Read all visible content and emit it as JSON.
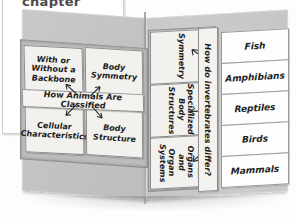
{
  "page": {
    "chapter_label": "chapter",
    "colors": {
      "board": "#c6c6c6",
      "card_paper": "#f2f1ee",
      "card_white": "#fdfdfd",
      "ink": "#1d1d1d",
      "card_border": "#8d8d8d"
    }
  },
  "left_panel": {
    "banner": "How Animals Are Classified",
    "cards": [
      {
        "label": "With or\nWithout a\nBackbone"
      },
      {
        "label": "Body\nSymmetry"
      },
      {
        "label": "Cellular\nCharacteristics"
      },
      {
        "label": "Body\nStructure"
      }
    ]
  },
  "middle_panel": {
    "question": "How do invertebrates differ?",
    "cards": [
      {
        "label": "Symmetry"
      },
      {
        "label": "Specialized\nBody\nStructures"
      },
      {
        "label": "Internal\nOrgans and\nOrgan\nSystems"
      }
    ]
  },
  "right_panel": {
    "cards": [
      {
        "label": "Fish"
      },
      {
        "label": "Amphibians"
      },
      {
        "label": "Reptiles"
      },
      {
        "label": "Birds"
      },
      {
        "label": "Mammals"
      }
    ]
  }
}
